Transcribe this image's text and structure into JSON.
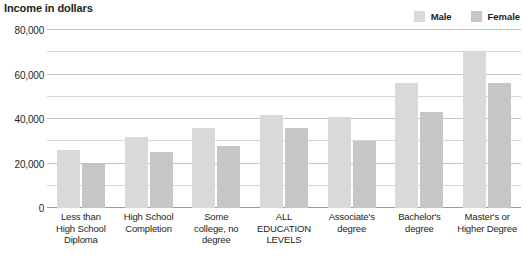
{
  "chart_data": {
    "type": "bar",
    "title": "Income in dollars",
    "xlabel": "",
    "ylabel": "Income in dollars",
    "ylim": [
      0,
      80000
    ],
    "ytick_values": [
      0,
      20000,
      40000,
      60000,
      80000
    ],
    "ytick_labels": [
      "0",
      "20,000",
      "40,000",
      "60,000",
      "80,000"
    ],
    "minor_gridline_values": [
      10000,
      30000,
      50000,
      70000
    ],
    "grid": true,
    "legend_position": "top-right",
    "categories": [
      "Less than High School Diploma",
      "High School Completion",
      "Some college, no degree",
      "ALL EDUCATION LEVELS",
      "Associate's degree",
      "Bachelor's degree",
      "Master's or Higher Degree"
    ],
    "category_label_lines": [
      [
        "Less than",
        "High School",
        "Diploma"
      ],
      [
        "High School",
        "Completion"
      ],
      [
        "Some",
        "college, no",
        "degree"
      ],
      [
        "ALL",
        "EDUCATION",
        "LEVELS"
      ],
      [
        "Associate's",
        "degree"
      ],
      [
        "Bachelor's",
        "degree"
      ],
      [
        "Master's or",
        "Higher Degree"
      ]
    ],
    "series": [
      {
        "name": "Male",
        "color": "#d9d9d9",
        "values": [
          26000,
          32000,
          36000,
          42000,
          41000,
          56000,
          70000
        ]
      },
      {
        "name": "Female",
        "color": "#c6c6c6",
        "values": [
          20000,
          25000,
          28000,
          36000,
          30000,
          43000,
          56000
        ]
      }
    ]
  },
  "legend": {
    "entries": [
      {
        "label": "Male",
        "color": "#d9d9d9"
      },
      {
        "label": "Female",
        "color": "#c6c6c6"
      }
    ]
  },
  "colors": {
    "male_bar": "#d9d9d9",
    "female_bar": "#c6c6c6",
    "gridline": "#d6d6d6",
    "gridline_major": "#c4c4c4",
    "baseline": "#9a9a9a",
    "text": "#231f20",
    "background": "#ffffff"
  }
}
